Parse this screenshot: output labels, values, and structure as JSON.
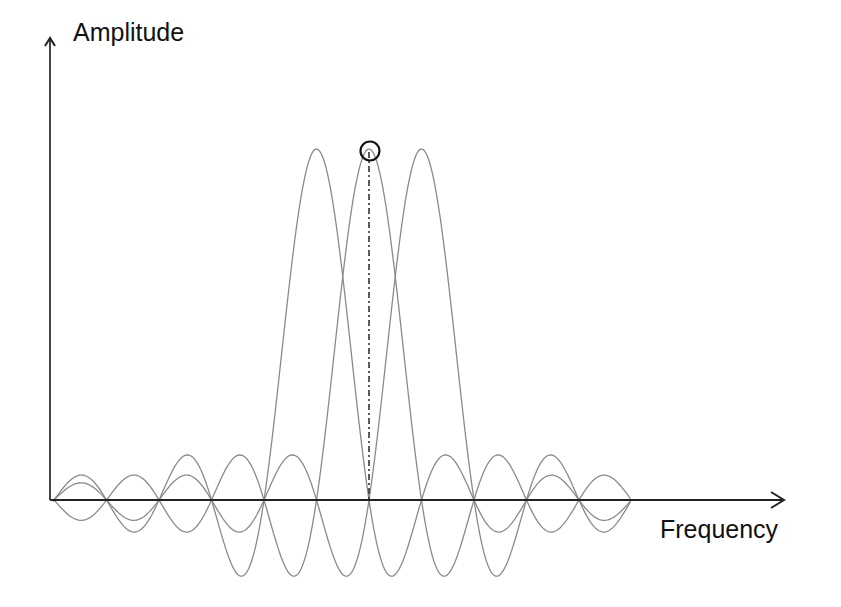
{
  "diagram": {
    "title": "",
    "y_axis": {
      "label": "Amplitude"
    },
    "x_axis": {
      "label": "Frequency"
    },
    "colors": {
      "axis": "#222222",
      "curve": "#8a8a8a",
      "marker": "#111111",
      "background": "#ffffff"
    }
  },
  "chart_data": {
    "type": "line",
    "title": "",
    "xlabel": "Frequency",
    "ylabel": "Amplitude",
    "series": [
      {
        "name": "subcarrier-1",
        "center_index": -1,
        "peak": 1.0
      },
      {
        "name": "subcarrier-2",
        "center_index": 0,
        "peak": 1.0,
        "highlighted_peak": true
      },
      {
        "name": "subcarrier-3",
        "center_index": 1,
        "peak": 1.0
      }
    ],
    "zero_crossing_spacing": 1,
    "x_range": [
      -6,
      5
    ],
    "grid": false,
    "legend": "none"
  }
}
